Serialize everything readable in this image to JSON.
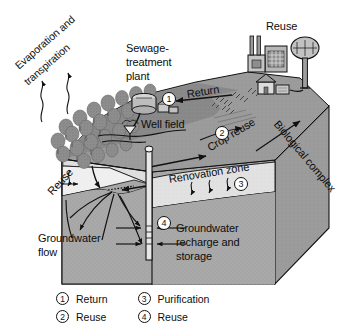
{
  "figure": {
    "type": "block-diagram",
    "palette": {
      "ink": "#111111",
      "paper": "#ffffff",
      "block_face": "#a9a9a9",
      "block_side": "#9a9a9a",
      "surface_dark": "#8d8d8d",
      "surface_mid": "#a0a0a0",
      "renovation_zone": "#dcdcdc",
      "aquifer_light": "#e8e8e8",
      "tree_gray": "#8f8f8f"
    }
  },
  "labels": {
    "evaporation_line1": "Evaporation and",
    "evaporation_line2": "transpiration",
    "sewage_line1": "Sewage-",
    "sewage_line2": "treatment",
    "sewage_line3": "plant",
    "return": "Return",
    "reuse_top": "Reuse",
    "crop_reuse": "Crop reuse",
    "well_field": "Well field",
    "reuse_left": "Reuse",
    "renovation_zone": "Renovation zone",
    "biological_complex": "Biological complex",
    "groundwater_flow_line1": "Groundwater",
    "groundwater_flow_line2": "flow",
    "recharge_line1": "Groundwater",
    "recharge_line2": "recharge and",
    "recharge_line3": "storage"
  },
  "callouts": [
    {
      "id": "callout-1",
      "number": "1",
      "refers_to": "Return"
    },
    {
      "id": "callout-2",
      "number": "2",
      "refers_to": "Crop reuse"
    },
    {
      "id": "callout-3",
      "number": "3",
      "refers_to": "Renovation zone"
    },
    {
      "id": "callout-4",
      "number": "4",
      "refers_to": "Recharge well"
    }
  ],
  "legend": {
    "left_column": [
      {
        "number": "1",
        "label": "Return"
      },
      {
        "number": "2",
        "label": "Reuse"
      }
    ],
    "right_column": [
      {
        "number": "3",
        "label": "Purification"
      },
      {
        "number": "4",
        "label": "Reuse"
      }
    ]
  }
}
